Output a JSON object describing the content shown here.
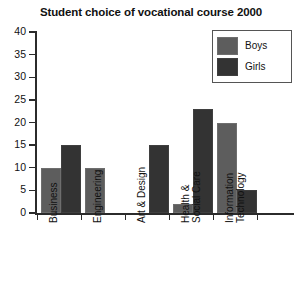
{
  "chart_data": {
    "type": "bar",
    "title": "Student choice of vocational course 2000",
    "xlabel": "",
    "ylabel": "",
    "ylim": [
      0,
      40
    ],
    "ytick_step": 5,
    "yticks": [
      "40",
      "35",
      "30",
      "25",
      "20",
      "15",
      "10",
      "5",
      "0"
    ],
    "grid": false,
    "legend_position": "top-right",
    "categories": [
      "Business",
      "Engineering",
      "Art & Design",
      "Health & Social Care",
      "Information Technology"
    ],
    "category_lines": [
      [
        "Business"
      ],
      [
        "Engineering"
      ],
      [
        "Art & Design"
      ],
      [
        "Health &",
        "Social Care"
      ],
      [
        "Information",
        "Technology"
      ]
    ],
    "series": [
      {
        "name": "Boys",
        "color": "#5d5d5d",
        "values": [
          10,
          10,
          0,
          2,
          20
        ]
      },
      {
        "name": "Girls",
        "color": "#333333",
        "values": [
          15,
          0,
          15,
          23,
          5
        ]
      }
    ]
  },
  "legend": {
    "items": [
      {
        "label": "Boys"
      },
      {
        "label": "Girls"
      }
    ]
  },
  "colors": {
    "boys": "#5d5d5d",
    "girls": "#333333",
    "axis": "#2b2b2b",
    "background": "#ffffff",
    "text": "#111111"
  }
}
